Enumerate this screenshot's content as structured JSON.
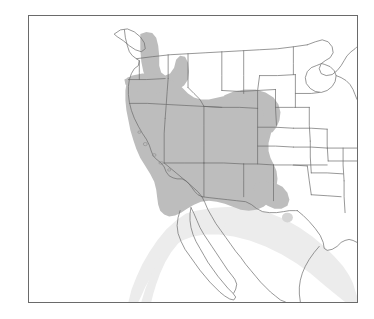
{
  "figure": {
    "type": "distribution-range-map",
    "region": "Western North America",
    "background_color": "#ffffff",
    "frame": {
      "border_color": "#6a6a6a",
      "border_width_px": 1,
      "x": 28,
      "y": 15,
      "width": 330,
      "height": 288
    }
  },
  "map": {
    "boundary_line_color": "#6b6b6b",
    "boundary_line_width_px": 0.7,
    "coastline_color": "#6b6b6b",
    "land_fill": "#ffffff",
    "ocean_fill": "#ffffff"
  },
  "ranges": [
    {
      "id": "core-range",
      "label": "Core range",
      "fill": "#bdbdbd",
      "description": "Great Basin and Columbia Plateau: eastern Oregon, Nevada, Utah, southern Idaho, western Colorado, northern Arizona and New Mexico, extending north through the Idaho panhandle into northeastern Washington"
    },
    {
      "id": "southern-extension",
      "label": "Southern extension",
      "fill": "#ececec",
      "description": "Sierra Madre Occidental corridor extending southeast through Sonora, Chihuahua and Durango in northern Mexico"
    },
    {
      "id": "texas-outlier",
      "label": "Isolated outlier",
      "fill": "#d5d5d5",
      "description": "Small disjunct patch in the Trans-Pecos region of western Texas"
    }
  ],
  "features": {
    "islands": [
      "Vancouver Island",
      "Channel Islands",
      "Baja California peninsula"
    ],
    "water_bodies": [
      "Gulf of California",
      "Great Lakes",
      "Great Salt Lake"
    ]
  }
}
